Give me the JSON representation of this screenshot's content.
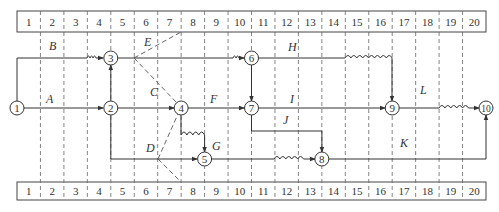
{
  "time_scale": {
    "top_labels": [
      "1",
      "2",
      "3",
      "4",
      "5",
      "6",
      "7",
      "8",
      "9",
      "10",
      "11",
      "12",
      "13",
      "14",
      "15",
      "16",
      "17",
      "18",
      "19",
      "20"
    ],
    "bottom_labels": [
      "1",
      "2",
      "3",
      "4",
      "5",
      "6",
      "7",
      "8",
      "9",
      "10",
      "11",
      "12",
      "13",
      "14",
      "15",
      "16",
      "17",
      "18",
      "19",
      "20"
    ]
  },
  "nodes": [
    {
      "id": "1",
      "label": "1",
      "time": 0,
      "row": "middle"
    },
    {
      "id": "2",
      "label": "2",
      "time": 4,
      "row": "middle"
    },
    {
      "id": "3",
      "label": "3",
      "time": 4,
      "row": "top"
    },
    {
      "id": "4",
      "label": "4",
      "time": 7,
      "row": "middle"
    },
    {
      "id": "5",
      "label": "5",
      "time": 8,
      "row": "bottom"
    },
    {
      "id": "6",
      "label": "6",
      "time": 10,
      "row": "top"
    },
    {
      "id": "7",
      "label": "7",
      "time": 10,
      "row": "middle"
    },
    {
      "id": "8",
      "label": "8",
      "time": 13,
      "row": "bottom"
    },
    {
      "id": "9",
      "label": "9",
      "time": 16,
      "row": "middle"
    },
    {
      "id": "10",
      "label": "10",
      "time": 20,
      "row": "middle"
    }
  ],
  "activities": [
    {
      "label": "A",
      "from": "1",
      "to": "2",
      "duration": 4,
      "free_float": 0
    },
    {
      "label": "B",
      "from": "1",
      "to": "3",
      "duration": 3,
      "free_float": 1
    },
    {
      "label": "C",
      "from": "2",
      "to": "4",
      "duration": 3,
      "free_float": 0
    },
    {
      "label": "D",
      "from": "2",
      "to": "5",
      "duration": 4,
      "free_float": 0
    },
    {
      "label": "E",
      "from": "3",
      "to": "6",
      "duration": 5,
      "free_float": 1
    },
    {
      "label": "F",
      "from": "4",
      "to": "7",
      "duration": 3,
      "free_float": 0
    },
    {
      "label": "G",
      "from": "4",
      "to": "5",
      "duration": 0,
      "free_float": 1
    },
    {
      "label": "H",
      "from": "6",
      "to": "9",
      "duration": 4,
      "free_float": 2
    },
    {
      "label": "I",
      "from": "7",
      "to": "9",
      "duration": 6,
      "free_float": 0
    },
    {
      "label": "J",
      "from": "7",
      "to": "8",
      "duration": 3,
      "free_float": 0
    },
    {
      "label": "K",
      "from": "8",
      "to": "10",
      "duration": 7,
      "free_float": 0
    },
    {
      "label": "L",
      "from": "9",
      "to": "10",
      "duration": 2,
      "free_float": 2
    }
  ],
  "dummy_activities": [
    {
      "from": "3",
      "to": "4"
    },
    {
      "from": "6",
      "to": "7"
    },
    {
      "from": "3",
      "to": "2",
      "note": "vertical link"
    }
  ]
}
